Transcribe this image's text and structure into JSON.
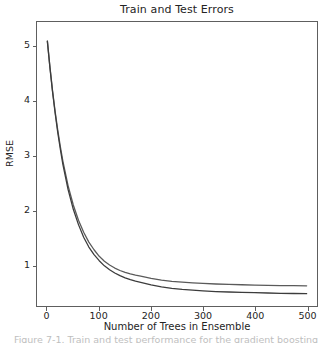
{
  "figure": {
    "caption_clipped": "Figure 7-1. Train and test performance for the gradient boosting"
  },
  "chart_data": {
    "type": "line",
    "title": "Train and Test Errors",
    "xlabel": "Number of Trees in Ensemble",
    "ylabel": "RMSE",
    "xlim": [
      -20,
      520
    ],
    "ylim": [
      0.25,
      5.45
    ],
    "grid": false,
    "legend": "none",
    "xticks": [
      "0",
      "100",
      "200",
      "300",
      "400",
      "500"
    ],
    "xtick_values": [
      0,
      100,
      200,
      300,
      400,
      500
    ],
    "yticks": [
      "1",
      "2",
      "3",
      "4",
      "5"
    ],
    "ytick_values": [
      1,
      2,
      3,
      4,
      5
    ],
    "x": [
      0,
      5,
      10,
      15,
      20,
      25,
      30,
      40,
      50,
      60,
      70,
      80,
      90,
      100,
      110,
      120,
      130,
      140,
      150,
      160,
      170,
      180,
      200,
      220,
      240,
      260,
      280,
      300,
      325,
      350,
      375,
      400,
      425,
      450,
      475,
      500
    ],
    "series": [
      {
        "name": "Test error",
        "color": "#5a5a5a",
        "values": [
          5.1,
          4.62,
          4.19,
          3.81,
          3.47,
          3.17,
          2.9,
          2.45,
          2.1,
          1.82,
          1.6,
          1.42,
          1.28,
          1.16,
          1.07,
          1.0,
          0.945,
          0.9,
          0.865,
          0.838,
          0.816,
          0.798,
          0.755,
          0.725,
          0.702,
          0.686,
          0.673,
          0.663,
          0.653,
          0.645,
          0.639,
          0.634,
          0.629,
          0.625,
          0.622,
          0.62
        ]
      },
      {
        "name": "Train error",
        "color": "#3c3c3c",
        "values": [
          5.1,
          4.61,
          4.17,
          3.78,
          3.43,
          3.12,
          2.84,
          2.38,
          2.02,
          1.74,
          1.51,
          1.33,
          1.19,
          1.08,
          0.985,
          0.915,
          0.855,
          0.805,
          0.765,
          0.732,
          0.705,
          0.682,
          0.635,
          0.6,
          0.574,
          0.554,
          0.539,
          0.527,
          0.515,
          0.506,
          0.499,
          0.493,
          0.488,
          0.483,
          0.479,
          0.476
        ]
      }
    ]
  }
}
